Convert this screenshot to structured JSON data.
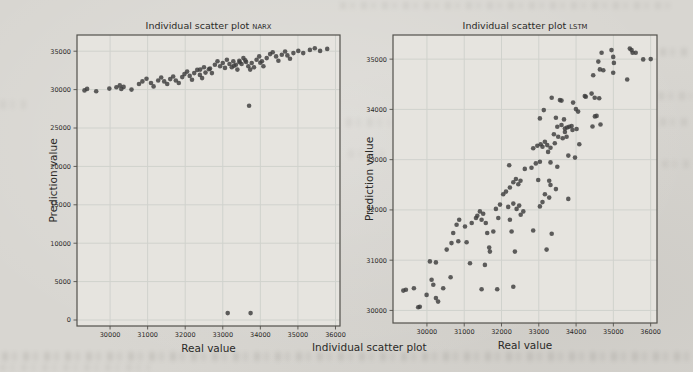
{
  "page": {
    "caption": "Individual scatter plot"
  },
  "colors": {
    "page_background": "#d8d6d1",
    "plot_interior": "#e6e4df",
    "grid_line": "#d0d2cd",
    "axis_border": "#53514c",
    "dot": "#3d3d3d",
    "text": "#2b2a28"
  },
  "chart_data": [
    {
      "type": "scatter",
      "name": "narx-scatter-plot",
      "title": "Individual scatter plot",
      "title_suffix": "NARX",
      "xlabel": "Real value",
      "ylabel": "Prediction value",
      "xlim": [
        29120,
        36120
      ],
      "ylim": [
        -780,
        37110
      ],
      "xticks": [
        30000,
        31000,
        32000,
        33000,
        34000,
        35000,
        36000
      ],
      "yticks": [
        0,
        5000,
        10000,
        15000,
        20000,
        25000,
        30000,
        35000
      ],
      "grid": true,
      "legend": null,
      "points": [
        [
          29320,
          29900
        ],
        [
          29390,
          30090
        ],
        [
          29630,
          29780
        ],
        [
          29980,
          30130
        ],
        [
          30170,
          30300
        ],
        [
          30260,
          30550
        ],
        [
          30300,
          30090
        ],
        [
          30360,
          30350
        ],
        [
          30570,
          30000
        ],
        [
          30770,
          30730
        ],
        [
          30860,
          31070
        ],
        [
          30970,
          31410
        ],
        [
          31090,
          30860
        ],
        [
          31160,
          30420
        ],
        [
          31280,
          31190
        ],
        [
          31360,
          31580
        ],
        [
          31440,
          31070
        ],
        [
          31520,
          30730
        ],
        [
          31600,
          31370
        ],
        [
          31680,
          31700
        ],
        [
          31750,
          31190
        ],
        [
          31830,
          30860
        ],
        [
          31920,
          31630
        ],
        [
          31980,
          32020
        ],
        [
          32050,
          32350
        ],
        [
          32120,
          31790
        ],
        [
          32180,
          31280
        ],
        [
          32240,
          32150
        ],
        [
          32320,
          32570
        ],
        [
          32390,
          31920
        ],
        [
          32450,
          31500
        ],
        [
          32540,
          32220
        ],
        [
          32630,
          32660
        ],
        [
          32710,
          32150
        ],
        [
          32400,
          32600
        ],
        [
          32500,
          32910
        ],
        [
          32660,
          32730
        ],
        [
          32790,
          33240
        ],
        [
          32860,
          33680
        ],
        [
          32930,
          33040
        ],
        [
          33000,
          33460
        ],
        [
          33060,
          32820
        ],
        [
          33110,
          33890
        ],
        [
          33180,
          33330
        ],
        [
          33240,
          32910
        ],
        [
          33280,
          33680
        ],
        [
          33300,
          33100
        ],
        [
          33350,
          33240
        ],
        [
          33390,
          32600
        ],
        [
          33440,
          33760
        ],
        [
          33450,
          33550
        ],
        [
          33500,
          33330
        ],
        [
          33550,
          34100
        ],
        [
          33600,
          33800
        ],
        [
          33620,
          33590
        ],
        [
          33680,
          33040
        ],
        [
          33730,
          32600
        ],
        [
          33770,
          33460
        ],
        [
          33830,
          32910
        ],
        [
          33900,
          33890
        ],
        [
          33970,
          34320
        ],
        [
          34000,
          33500
        ],
        [
          34040,
          33680
        ],
        [
          34080,
          33040
        ],
        [
          34170,
          34100
        ],
        [
          34260,
          34620
        ],
        [
          34330,
          34870
        ],
        [
          34420,
          34320
        ],
        [
          34480,
          33760
        ],
        [
          34570,
          34530
        ],
        [
          34660,
          34960
        ],
        [
          34720,
          34450
        ],
        [
          34790,
          34010
        ],
        [
          34880,
          34750
        ],
        [
          35010,
          35040
        ],
        [
          35140,
          34750
        ],
        [
          35320,
          35170
        ],
        [
          35450,
          35390
        ],
        [
          35590,
          35040
        ],
        [
          35780,
          35300
        ],
        [
          33700,
          27900
        ],
        [
          33130,
          900
        ],
        [
          33740,
          900
        ]
      ]
    },
    {
      "type": "scatter",
      "name": "lstm-scatter-plot",
      "title": "Individual scatter plot",
      "title_suffix": "LSTM",
      "xlabel": "Real value",
      "ylabel": "Prediction value",
      "xlim": [
        29090,
        36170
      ],
      "ylim": [
        29750,
        35480
      ],
      "xticks": [
        30000,
        31000,
        32000,
        33000,
        34000,
        35000,
        36000
      ],
      "yticks": [
        30000,
        31000,
        32000,
        33000,
        34000,
        35000
      ],
      "grid": true,
      "legend": null,
      "points": [
        [
          29365,
          30395
        ],
        [
          29435,
          30410
        ],
        [
          29650,
          30440
        ],
        [
          29765,
          30065
        ],
        [
          29810,
          30075
        ],
        [
          29990,
          30310
        ],
        [
          30080,
          30975
        ],
        [
          30125,
          30610
        ],
        [
          30170,
          30510
        ],
        [
          30240,
          30245
        ],
        [
          30240,
          30955
        ],
        [
          30300,
          30175
        ],
        [
          30435,
          30440
        ],
        [
          30530,
          31210
        ],
        [
          30635,
          30660
        ],
        [
          30660,
          31340
        ],
        [
          30705,
          31540
        ],
        [
          30795,
          31705
        ],
        [
          30840,
          31375
        ],
        [
          30865,
          31805
        ],
        [
          31020,
          31670
        ],
        [
          31065,
          31355
        ],
        [
          31155,
          30940
        ],
        [
          31200,
          31740
        ],
        [
          31315,
          31840
        ],
        [
          31350,
          31885
        ],
        [
          31420,
          31970
        ],
        [
          31465,
          31805
        ],
        [
          31465,
          30420
        ],
        [
          31510,
          31925
        ],
        [
          31555,
          30905
        ],
        [
          31580,
          31740
        ],
        [
          31615,
          31540
        ],
        [
          31670,
          31250
        ],
        [
          31690,
          31170
        ],
        [
          31780,
          31570
        ],
        [
          31850,
          32020
        ],
        [
          31885,
          30420
        ],
        [
          31915,
          31840
        ],
        [
          31960,
          32105
        ],
        [
          32045,
          32310
        ],
        [
          32120,
          32365
        ],
        [
          32180,
          32060
        ],
        [
          32205,
          32890
        ],
        [
          32225,
          31805
        ],
        [
          32225,
          32445
        ],
        [
          32270,
          31570
        ],
        [
          32315,
          32125
        ],
        [
          32315,
          30470
        ],
        [
          32315,
          32550
        ],
        [
          32360,
          31170
        ],
        [
          32385,
          32615
        ],
        [
          32405,
          32020
        ],
        [
          32450,
          32510
        ],
        [
          32475,
          32085
        ],
        [
          32510,
          32580
        ],
        [
          32515,
          31905
        ],
        [
          32585,
          31970
        ],
        [
          32625,
          32815
        ],
        [
          32805,
          32840
        ],
        [
          32850,
          31590
        ],
        [
          32850,
          33225
        ],
        [
          32920,
          32925
        ],
        [
          32960,
          33275
        ],
        [
          32985,
          32595
        ],
        [
          33030,
          32070
        ],
        [
          33030,
          32960
        ],
        [
          33030,
          33820
        ],
        [
          33050,
          33305
        ],
        [
          33100,
          32155
        ],
        [
          33100,
          33255
        ],
        [
          33135,
          33985
        ],
        [
          33165,
          32310
        ],
        [
          33165,
          33355
        ],
        [
          33210,
          31210
        ],
        [
          33225,
          33290
        ],
        [
          33250,
          33155
        ],
        [
          33280,
          32245
        ],
        [
          33280,
          32580
        ],
        [
          33315,
          32495
        ],
        [
          33315,
          32945
        ],
        [
          33315,
          33235
        ],
        [
          33345,
          31525
        ],
        [
          33345,
          34230
        ],
        [
          33405,
          33505
        ],
        [
          33430,
          33325
        ],
        [
          33460,
          32415
        ],
        [
          33460,
          33835
        ],
        [
          33495,
          32860
        ],
        [
          33495,
          33655
        ],
        [
          33520,
          33455
        ],
        [
          33565,
          34185
        ],
        [
          33610,
          33690
        ],
        [
          33610,
          34175
        ],
        [
          33640,
          33425
        ],
        [
          33675,
          33800
        ],
        [
          33700,
          33620
        ],
        [
          33700,
          33550
        ],
        [
          33745,
          33455
        ],
        [
          33760,
          33640
        ],
        [
          33790,
          32220
        ],
        [
          33790,
          33080
        ],
        [
          33815,
          33655
        ],
        [
          33880,
          33670
        ],
        [
          33905,
          33590
        ],
        [
          33920,
          34135
        ],
        [
          33970,
          33040
        ],
        [
          33995,
          34005
        ],
        [
          34015,
          33610
        ],
        [
          34055,
          33955
        ],
        [
          34085,
          33305
        ],
        [
          34235,
          34265
        ],
        [
          34260,
          34250
        ],
        [
          34415,
          34315
        ],
        [
          34440,
          33660
        ],
        [
          34460,
          34680
        ],
        [
          34500,
          34230
        ],
        [
          34505,
          33860
        ],
        [
          34550,
          33870
        ],
        [
          34595,
          34950
        ],
        [
          34620,
          34220
        ],
        [
          34640,
          34795
        ],
        [
          34655,
          33700
        ],
        [
          34685,
          35125
        ],
        [
          34730,
          34780
        ],
        [
          34950,
          35180
        ],
        [
          34995,
          34730
        ],
        [
          34995,
          35045
        ],
        [
          35015,
          34925
        ],
        [
          35370,
          34595
        ],
        [
          35440,
          35210
        ],
        [
          35490,
          35180
        ],
        [
          35515,
          35125
        ],
        [
          35600,
          35125
        ],
        [
          35800,
          34995
        ],
        [
          36000,
          35000
        ]
      ]
    }
  ]
}
